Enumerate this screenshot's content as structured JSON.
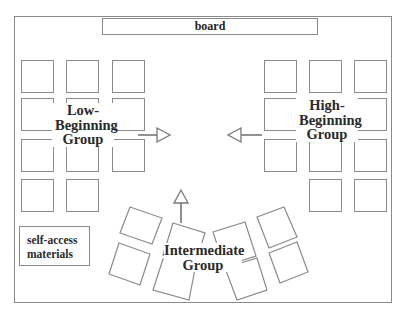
{
  "diagram": {
    "type": "classroom seating layout",
    "board": {
      "label": "board"
    },
    "self_access": {
      "lines": [
        "self-access",
        "materials"
      ]
    },
    "groups": {
      "low_beginning": {
        "lines": [
          "Low-",
          "Beginning",
          "Group"
        ],
        "desk_count": 11,
        "arrow_direction": "right"
      },
      "high_beginning": {
        "lines": [
          "High-",
          "Beginning",
          "Group"
        ],
        "desk_count": 11,
        "arrow_direction": "left"
      },
      "intermediate": {
        "lines": [
          "Intermediate",
          "Group"
        ],
        "desk_count": 8,
        "arrow_direction": "up"
      }
    },
    "colors": {
      "line": "#8a8a8a",
      "text": "#2a2a2a",
      "background": "#ffffff"
    }
  }
}
